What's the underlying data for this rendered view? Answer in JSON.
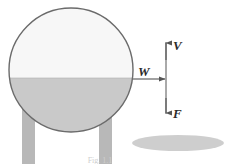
{
  "figure": {
    "kind": "physics-free-body-diagram",
    "caption": "Fig. 1.1",
    "background_color": "#ffffff"
  },
  "tank": {
    "name": "spherical-tank",
    "center_x": 71,
    "center_y": 70,
    "radius": 62,
    "outline_color": "#6b6b6b",
    "gas_region": {
      "label": "vapour-space",
      "fill_color": "#f7f7f7"
    },
    "liquid_region": {
      "label": "liquid-contents",
      "fill_color": "#c9c9c9",
      "surface_y": 78
    }
  },
  "legs": [
    {
      "name": "support-leg-left",
      "x": 22,
      "y": 108,
      "width": 13,
      "height": 56,
      "fill_color": "#b8b8b8"
    },
    {
      "name": "support-leg-right",
      "x": 99,
      "y": 108,
      "width": 13,
      "height": 56,
      "fill_color": "#b8b8b8"
    }
  ],
  "shadow": {
    "name": "ground-shadow",
    "cx": 178,
    "cy": 143,
    "rx": 46,
    "ry": 8,
    "fill_color": "#c6c6c6"
  },
  "vectors": {
    "axis_line": {
      "name": "vertical-force-axis",
      "x": 166,
      "y_top": 42,
      "y_bottom": 114,
      "color": "#555555"
    },
    "items": [
      {
        "name": "velocity-vector",
        "label": "V",
        "direction": "up",
        "label_x": 173,
        "label_y": 50,
        "color": "#2b2b2b"
      },
      {
        "name": "weight-vector",
        "label": "W",
        "direction": "right",
        "label_x": 138,
        "label_y": 76,
        "arrow_start_x": 133,
        "arrow_end_x": 166,
        "arrow_y": 79,
        "color": "#2b2b2b"
      },
      {
        "name": "force-vector",
        "label": "F",
        "direction": "down",
        "label_x": 173,
        "label_y": 118,
        "color": "#2b2b2b"
      }
    ]
  }
}
